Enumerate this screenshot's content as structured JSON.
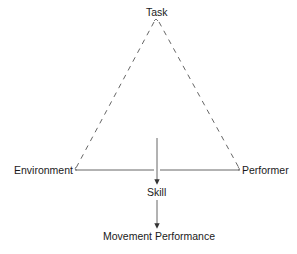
{
  "diagram": {
    "title": "",
    "nodes": {
      "task": "Task",
      "environment": "Environment",
      "performer": "Performer",
      "skill": "Skill",
      "movement_performance": "Movement Performance"
    },
    "edges": [
      {
        "from": "task",
        "to": "environment",
        "style": "dashed"
      },
      {
        "from": "task",
        "to": "performer",
        "style": "dashed"
      },
      {
        "from": "environment",
        "to": "performer",
        "style": "solid"
      },
      {
        "from": "center",
        "to": "skill",
        "style": "arrow"
      },
      {
        "from": "skill",
        "to": "movement_performance",
        "style": "arrow"
      }
    ],
    "colors": {
      "line": "#555555",
      "text": "#1a1a1a",
      "background": "#ffffff"
    }
  }
}
